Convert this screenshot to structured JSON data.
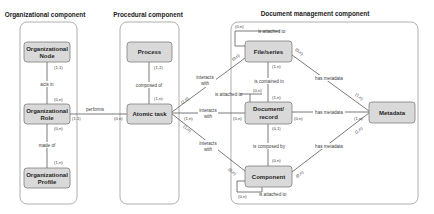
{
  "components": {
    "organizational": {
      "title": "Organizational component"
    },
    "procedural": {
      "title": "Procedural component"
    },
    "document_management": {
      "title": "Document management component"
    }
  },
  "entities": {
    "org_node": {
      "line1": "Organizational",
      "line2": "Node"
    },
    "org_role": {
      "line1": "Organizational",
      "line2": "Role"
    },
    "org_profile": {
      "line1": "Organizational",
      "line2": "Profile"
    },
    "process": {
      "line1": "Process"
    },
    "atomic_task": {
      "line1": "Atomic task"
    },
    "file_series": {
      "line1": "File/series"
    },
    "document_record": {
      "line1": "Document/",
      "line2": "record"
    },
    "component": {
      "line1": "Component"
    },
    "metadata": {
      "line1": "Metadata"
    }
  },
  "relationships": {
    "acts_in": {
      "label": "acts in",
      "card_node": "(1,1)",
      "card_role": "(0,n)"
    },
    "made_of": {
      "label": "made of",
      "card_role": "(0,n)",
      "card_profile": "(1,n)"
    },
    "performs": {
      "label": "performs",
      "card_role": "(1,1)",
      "card_task": "(0,n)"
    },
    "composed_of": {
      "label": "composed of",
      "card_process": "(1,1)",
      "card_task": "(1,n)"
    },
    "interacts_file": {
      "line1": "interacts",
      "line2": "with",
      "card_task": "(1,n)",
      "card_file": "(0,n)"
    },
    "interacts_doc": {
      "line1": "interacts",
      "line2": "with",
      "card_task": "(1,n)",
      "card_doc": "(0,n)"
    },
    "interacts_comp": {
      "line1": "interacts",
      "line2": "with",
      "card_task": "(1,n)",
      "card_comp": "(0,n)"
    },
    "file_attached": {
      "label": "is attached to",
      "card": "(0,n)"
    },
    "doc_attached": {
      "label": "is attached to",
      "card": "(0,n)"
    },
    "comp_attached": {
      "label": "is attached to",
      "card": "(0,n)"
    },
    "contained_in": {
      "label": "is contained in",
      "card_file": "(1,n)",
      "card_doc": "(1,n)"
    },
    "composed_by": {
      "label": "is composed by",
      "card_doc": "(0,1)",
      "card_comp": "(0,n)"
    },
    "file_metadata": {
      "label": "has metadata",
      "card_file": "(0,n)",
      "card_meta": "(1,n)"
    },
    "doc_metadata": {
      "label": "has metadata",
      "card_doc": "(0,n)",
      "card_meta": "(1,n)"
    },
    "comp_metadata": {
      "label": "has metadata",
      "card_comp": "(0,n)",
      "card_meta": "(1,n)"
    }
  }
}
